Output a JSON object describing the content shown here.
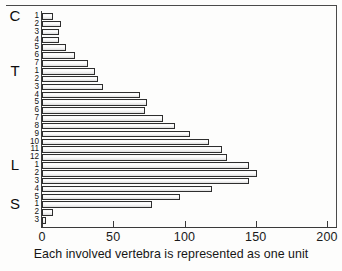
{
  "caption": "Each involved vertebra is represented as one unit",
  "axis": {
    "x_ticks": [
      "0",
      "50",
      "100",
      "150",
      "200"
    ]
  },
  "groups": [
    {
      "letter": "C",
      "start_index": 0,
      "count": 7
    },
    {
      "letter": "T",
      "start_index": 7,
      "count": 12
    },
    {
      "letter": "L",
      "start_index": 19,
      "count": 5
    },
    {
      "letter": "S",
      "start_index": 24,
      "count": 3
    }
  ],
  "chart_data": {
    "type": "bar",
    "orientation": "horizontal",
    "title": "",
    "subtitle": "",
    "xlabel": "Each involved vertebra is represented as one unit",
    "ylabel": "",
    "xlim": [
      0,
      200
    ],
    "ylim": [
      0,
      27
    ],
    "grid": false,
    "legend": null,
    "xticks": [
      0,
      50,
      100,
      150,
      200
    ],
    "categories": [
      "C1",
      "C2",
      "C3",
      "C4",
      "C5",
      "C6",
      "C7",
      "T1",
      "T2",
      "T3",
      "T4",
      "T5",
      "T6",
      "T7",
      "T8",
      "T9",
      "T10",
      "T11",
      "T12",
      "L1",
      "L2",
      "L3",
      "L4",
      "L5",
      "S1",
      "S2",
      "S3"
    ],
    "tick_labels": [
      "1",
      "2",
      "3",
      "4",
      "5",
      "6",
      "7",
      "1",
      "2",
      "3",
      "4",
      "5",
      "6",
      "7",
      "8",
      "9",
      "10",
      "11",
      "12",
      "1",
      "2",
      "3",
      "4",
      "5",
      "1",
      "2",
      "3"
    ],
    "values": [
      8,
      13,
      12,
      12,
      17,
      23,
      32,
      37,
      39,
      43,
      69,
      74,
      72,
      85,
      93,
      104,
      117,
      126,
      130,
      145,
      151,
      145,
      119,
      97,
      77,
      8,
      3
    ]
  }
}
